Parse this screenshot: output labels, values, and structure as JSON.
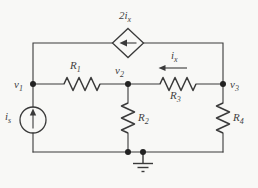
{
  "figure": {
    "type": "circuit-diagram",
    "colors": {
      "background": "#f8f8f6",
      "line": "#3a3a3a",
      "text": "#3f3f3f",
      "dot": "#222222"
    }
  },
  "labels": {
    "dependent_source": {
      "base": "2i",
      "sub": "x"
    },
    "independent_source": {
      "base": "i",
      "sub": "s"
    },
    "branch_current": {
      "base": "i",
      "sub": "x"
    },
    "node_v1": {
      "base": "v",
      "sub": "1"
    },
    "node_v2": {
      "base": "v",
      "sub": "2"
    },
    "node_v3": {
      "base": "v",
      "sub": "3"
    },
    "resistor_r1": {
      "base": "R",
      "sub": "1"
    },
    "resistor_r2": {
      "base": "R",
      "sub": "2"
    },
    "resistor_r3": {
      "base": "R",
      "sub": "3"
    },
    "resistor_r4": {
      "base": "R",
      "sub": "4"
    }
  }
}
